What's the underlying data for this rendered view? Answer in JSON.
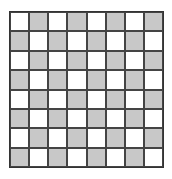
{
  "board": {
    "rows": 8,
    "cols": 8,
    "colors": {
      "light": "#ffffff",
      "dark": "#c8c8c8",
      "line": "#444444"
    },
    "top_left": "light"
  }
}
